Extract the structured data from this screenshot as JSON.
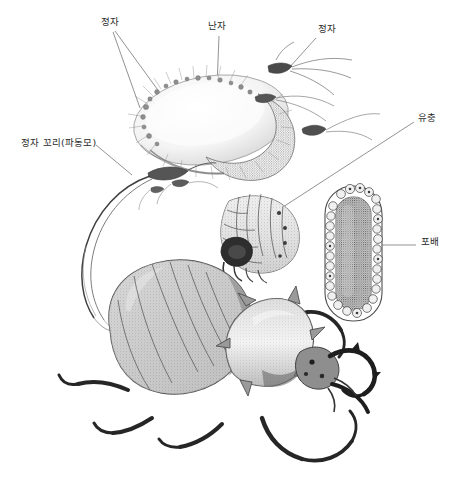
{
  "figure": {
    "background_color": "#ffffff",
    "ink_color": "#2b2b2b",
    "width": 462,
    "height": 495
  },
  "labels": [
    {
      "id": "sperm-left",
      "text": "정자",
      "x": 101,
      "y": 17,
      "meaning": "sperm"
    },
    {
      "id": "ovum",
      "text": "난자",
      "x": 208,
      "y": 21,
      "meaning": "ovum"
    },
    {
      "id": "sperm-right",
      "text": "정자",
      "x": 318,
      "y": 24,
      "meaning": "sperm"
    },
    {
      "id": "sperm-tail",
      "text": "정자 꼬리(파동모)",
      "x": 21,
      "y": 138,
      "meaning": "sperm tail (flagellum)"
    },
    {
      "id": "larva",
      "text": "유충",
      "x": 418,
      "y": 113,
      "meaning": "larva"
    },
    {
      "id": "blastula",
      "text": "포배",
      "x": 421,
      "y": 237,
      "meaning": "blastula"
    }
  ],
  "specimens": [
    {
      "id": "ovum-body",
      "name": "난자 (egg cell with attached sperm)"
    },
    {
      "id": "sperm-cells",
      "name": "정자 (free sperm cells)"
    },
    {
      "id": "larva-body",
      "name": "유충 (grub larva)"
    },
    {
      "id": "blastula-body",
      "name": "포배 (blastula section)"
    },
    {
      "id": "beetle-body",
      "name": "성충 딱정벌레 (adult stag beetle)"
    }
  ]
}
